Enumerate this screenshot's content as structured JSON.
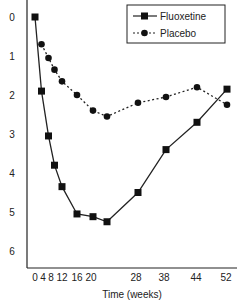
{
  "chart_data": {
    "type": "line",
    "title": "",
    "xlabel": "Time (weeks)",
    "ylabel": "",
    "x": [
      0,
      4,
      8,
      12,
      16,
      20,
      28,
      38,
      44,
      52
    ],
    "x_tick_labels": [
      "0",
      "4",
      "8",
      "12",
      "16",
      "20",
      "28",
      "38",
      "44",
      "52"
    ],
    "y_tick_labels": [
      "0",
      "1",
      "2",
      "3",
      "4",
      "5",
      "6"
    ],
    "ylim": [
      0,
      6.5
    ],
    "y_inverted": true,
    "grid": false,
    "legend_position": "upper right",
    "series": [
      {
        "name": "Fluoxetine",
        "style": "solid line, square markers",
        "points": [
          {
            "x": 0,
            "y": 0
          },
          {
            "x": 2,
            "y": 1.9
          },
          {
            "x": 4,
            "y": 3.05
          },
          {
            "x": 6,
            "y": 3.8
          },
          {
            "x": 8,
            "y": 4.35
          },
          {
            "x": 12,
            "y": 5.05
          },
          {
            "x": 16,
            "y": 5.12
          },
          {
            "x": 20,
            "y": 5.25
          },
          {
            "x": 28,
            "y": 4.5
          },
          {
            "x": 38,
            "y": 3.4
          },
          {
            "x": 44,
            "y": 2.7
          },
          {
            "x": 52,
            "y": 1.85
          }
        ]
      },
      {
        "name": "Placebo",
        "style": "dashed line, circle markers",
        "points": [
          {
            "x": 2,
            "y": 0.7
          },
          {
            "x": 4,
            "y": 1.05
          },
          {
            "x": 6,
            "y": 1.35
          },
          {
            "x": 8,
            "y": 1.65
          },
          {
            "x": 12,
            "y": 2.0
          },
          {
            "x": 16,
            "y": 2.4
          },
          {
            "x": 20,
            "y": 2.55
          },
          {
            "x": 28,
            "y": 2.2
          },
          {
            "x": 38,
            "y": 2.05
          },
          {
            "x": 44,
            "y": 1.8
          },
          {
            "x": 52,
            "y": 2.25
          }
        ]
      }
    ]
  },
  "legend": {
    "fluoxetine": "Fluoxetine",
    "placebo": "Placebo"
  },
  "axis": {
    "xlabel": "Time (weeks)"
  }
}
